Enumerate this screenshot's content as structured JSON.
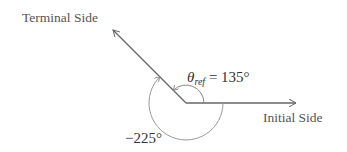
{
  "diagram": {
    "title": "",
    "labels": {
      "terminal_side": "Terminal Side",
      "initial_side": "Initial Side",
      "theta_symbol": "θ",
      "theta_subscript": "ref",
      "theta_value": "= 135°",
      "negative_angle": "−225°"
    },
    "angles": {
      "reference_angle_deg": 135,
      "negative_angle_deg": -225
    },
    "colors": {
      "line": "#666666",
      "arc": "#999999",
      "text": "#555555"
    }
  }
}
